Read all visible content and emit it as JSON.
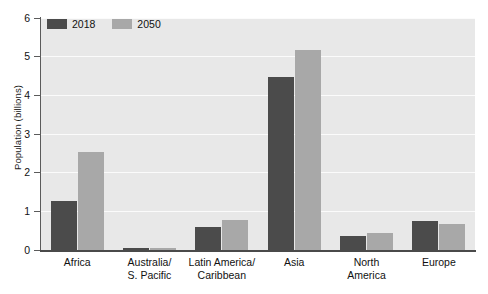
{
  "chart_data": {
    "type": "bar",
    "title": "",
    "subtitle": "",
    "xlabel": "",
    "ylabel": "Population (billions)",
    "ylim": [
      0,
      6
    ],
    "ytick_labels": [
      "0",
      "1",
      "2",
      "3",
      "4",
      "5",
      "6"
    ],
    "ytick_values": [
      0,
      1,
      2,
      3,
      4,
      5,
      6
    ],
    "grid": true,
    "legend_position": "top-left",
    "categories": [
      "Africa",
      "Australia/\nS. Pacific",
      "Latin America/\nCaribbean",
      "Asia",
      "North\nAmerica",
      "Europe"
    ],
    "category_lines": [
      [
        "Africa"
      ],
      [
        "Australia/",
        "S. Pacific"
      ],
      [
        "Latin America/",
        "Caribbean"
      ],
      [
        "Asia"
      ],
      [
        "North",
        "America"
      ],
      [
        "Europe"
      ]
    ],
    "series": [
      {
        "name": "2018",
        "color": "#4b4b4b",
        "values": [
          1.28,
          0.04,
          0.59,
          4.48,
          0.37,
          0.74
        ]
      },
      {
        "name": "2050",
        "color": "#a8a8a8",
        "values": [
          2.53,
          0.05,
          0.78,
          5.17,
          0.43,
          0.67
        ]
      }
    ]
  },
  "legend": {
    "items": [
      {
        "label": "2018",
        "color": "#4b4b4b"
      },
      {
        "label": "2050",
        "color": "#a8a8a8"
      }
    ]
  },
  "axes": {
    "y_title": "Population (billions)"
  },
  "colors": {
    "plot_background": "#e8e8e8",
    "gridline": "#fbfbfb",
    "axis": "#4a4a4a",
    "series_2018": "#4b4b4b",
    "series_2050": "#a8a8a8",
    "text": "#111111"
  }
}
